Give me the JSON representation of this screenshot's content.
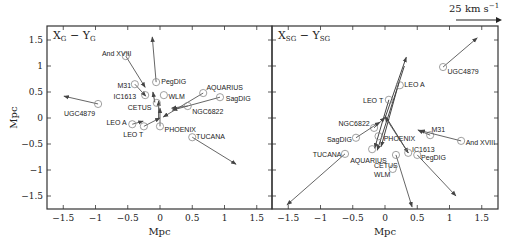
{
  "scale_bar": {
    "label": "25 km s",
    "exponent": "−1"
  },
  "chart_data": [
    {
      "type": "scatter",
      "title": "X_G − Y_G",
      "title_main_x": "X",
      "title_sub_x": "G",
      "title_main_y": "Y",
      "title_sub_y": "G",
      "xlabel": "Mpc",
      "ylabel": "Mpc",
      "xlim": [
        -1.75,
        1.75
      ],
      "ylim": [
        -1.75,
        1.75
      ],
      "xticks": [
        "−1.5",
        "−1",
        "−0.5",
        "0",
        "0.5",
        "1",
        "1.5"
      ],
      "yticks": [
        "1.5",
        "1",
        "0.5",
        "0",
        "−0.5",
        "−1",
        "−1.5"
      ],
      "points": [
        {
          "name": "And XVIII",
          "x": -0.53,
          "y": 1.19,
          "vx": 0.3,
          "vy": -0.6,
          "lx": -0.9,
          "ly": 1.24
        },
        {
          "name": "PegDIG",
          "x": -0.06,
          "y": 0.69,
          "vx": -0.06,
          "vy": 0.87,
          "lx": 0.02,
          "ly": 0.7
        },
        {
          "name": "M31",
          "x": -0.39,
          "y": 0.65,
          "vx": 0.17,
          "vy": -0.23,
          "lx": -0.66,
          "ly": 0.62
        },
        {
          "name": "IC1613",
          "x": -0.23,
          "y": 0.44,
          "vx": 0.0,
          "vy": 0.0,
          "lx": -0.72,
          "ly": 0.42
        },
        {
          "name": "WLM",
          "x": 0.06,
          "y": 0.44,
          "vx": 0.0,
          "vy": 0.0,
          "lx": 0.13,
          "ly": 0.42
        },
        {
          "name": "CETUS",
          "x": -0.05,
          "y": 0.29,
          "vx": 0.0,
          "vy": 0.0,
          "lx": -0.5,
          "ly": 0.21
        },
        {
          "name": "AQUARIUS",
          "x": 0.67,
          "y": 0.48,
          "vx": -0.62,
          "vy": -0.46,
          "lx": 0.72,
          "ly": 0.58
        },
        {
          "name": "SagDIG",
          "x": 0.93,
          "y": 0.4,
          "vx": -0.74,
          "vy": -0.25,
          "lx": 1.02,
          "ly": 0.38
        },
        {
          "name": "NGC6822",
          "x": 0.43,
          "y": 0.23,
          "vx": -0.25,
          "vy": -0.04,
          "lx": 0.5,
          "ly": 0.13
        },
        {
          "name": "UGC4879",
          "x": -0.96,
          "y": 0.27,
          "vx": -0.53,
          "vy": 0.15,
          "lx": -1.49,
          "ly": 0.08
        },
        {
          "name": "LEO A",
          "x": -0.43,
          "y": -0.12,
          "vx": 0.17,
          "vy": 0.06,
          "lx": -0.83,
          "ly": -0.08
        },
        {
          "name": "LEO T",
          "x": -0.25,
          "y": -0.16,
          "vx": 0.25,
          "vy": 0.16,
          "lx": -0.57,
          "ly": -0.32
        },
        {
          "name": "PHOENIX",
          "x": 0.0,
          "y": -0.16,
          "vx": 0.0,
          "vy": 0.35,
          "lx": 0.07,
          "ly": -0.22
        },
        {
          "name": "TUCANA",
          "x": 0.5,
          "y": -0.37,
          "vx": 0.68,
          "vy": -0.52,
          "lx": 0.56,
          "ly": -0.35
        }
      ],
      "extra_arrows": [
        {
          "x1": -0.02,
          "y1": 0.0,
          "x2": -0.02,
          "y2": 0.33
        },
        {
          "x1": -0.08,
          "y1": 0.3,
          "x2": -0.11,
          "y2": 0.5
        }
      ]
    },
    {
      "type": "scatter",
      "title": "X_SG − Y_SG",
      "title_main_x": "X",
      "title_sub_x": "SG",
      "title_main_y": "Y",
      "title_sub_y": "SG",
      "xlabel": "Mpc",
      "ylabel": "",
      "xlim": [
        -1.75,
        1.75
      ],
      "ylim": [
        -1.75,
        1.75
      ],
      "xticks": [
        "−1.5",
        "−1",
        "−0.5",
        "0",
        "0.5",
        "1",
        "1.5"
      ],
      "yticks": [],
      "points": [
        {
          "name": "UGC4879",
          "x": 0.9,
          "y": 0.98,
          "vx": 0.53,
          "vy": 0.56,
          "lx": 0.97,
          "ly": 0.9
        },
        {
          "name": "LEO A",
          "x": 0.23,
          "y": 0.63,
          "vx": 0.0,
          "vy": 0.0,
          "lx": 0.3,
          "ly": 0.64
        },
        {
          "name": "LEO T",
          "x": 0.06,
          "y": 0.35,
          "vx": 0.0,
          "vy": 0.0,
          "lx": -0.34,
          "ly": 0.33
        },
        {
          "name": "NGC6822",
          "x": -0.17,
          "y": -0.19,
          "vx": 0.17,
          "vy": 0.2,
          "lx": -0.72,
          "ly": -0.1
        },
        {
          "name": "SagDIG",
          "x": -0.45,
          "y": -0.38,
          "vx": 0.37,
          "vy": 0.3,
          "lx": -0.9,
          "ly": -0.42
        },
        {
          "name": "PHOENIX",
          "x": -0.1,
          "y": -0.35,
          "vx": 0.0,
          "vy": 0.0,
          "lx": -0.02,
          "ly": -0.39
        },
        {
          "name": "M31",
          "x": 0.7,
          "y": -0.33,
          "vx": -0.19,
          "vy": 0.1,
          "lx": 0.72,
          "ly": -0.22
        },
        {
          "name": "And XVIII",
          "x": 1.18,
          "y": -0.44,
          "vx": -0.64,
          "vy": 0.2,
          "lx": 1.25,
          "ly": -0.48
        },
        {
          "name": "IC1613",
          "x": 0.36,
          "y": -0.67,
          "vx": -0.36,
          "vy": 0.69,
          "lx": 0.42,
          "ly": -0.6
        },
        {
          "name": "PegDIG",
          "x": 0.5,
          "y": -0.71,
          "vx": 0.6,
          "vy": -0.79,
          "lx": 0.56,
          "ly": -0.76
        },
        {
          "name": "AQUARIUS",
          "x": -0.2,
          "y": -0.6,
          "vx": 0.0,
          "vy": 0.0,
          "lx": -0.54,
          "ly": -0.81
        },
        {
          "name": "CETUS",
          "x": 0.17,
          "y": -0.71,
          "vx": 0.25,
          "vy": -1.0,
          "lx": -0.17,
          "ly": -0.92
        },
        {
          "name": "WLM",
          "x": 0.12,
          "y": -0.98,
          "vx": 0.0,
          "vy": 0.0,
          "lx": -0.17,
          "ly": -1.09
        },
        {
          "name": "TUCANA",
          "x": -0.62,
          "y": -0.69,
          "vx": -0.9,
          "vy": -0.98,
          "lx": -1.12,
          "ly": -0.7
        }
      ],
      "extra_arrows": [
        {
          "x1": 0.0,
          "y1": 0.0,
          "x2": 0.33,
          "y2": 1.17
        },
        {
          "x1": 0.3,
          "y1": 1.0,
          "x2": -0.12,
          "y2": -0.62
        },
        {
          "x1": 0.22,
          "y1": 0.7,
          "x2": -0.06,
          "y2": -0.55
        },
        {
          "x1": 0.06,
          "y1": 0.35,
          "x2": -0.16,
          "y2": -0.58
        },
        {
          "x1": 0.0,
          "y1": 0.05,
          "x2": 0.36,
          "y2": -0.67
        }
      ]
    }
  ]
}
